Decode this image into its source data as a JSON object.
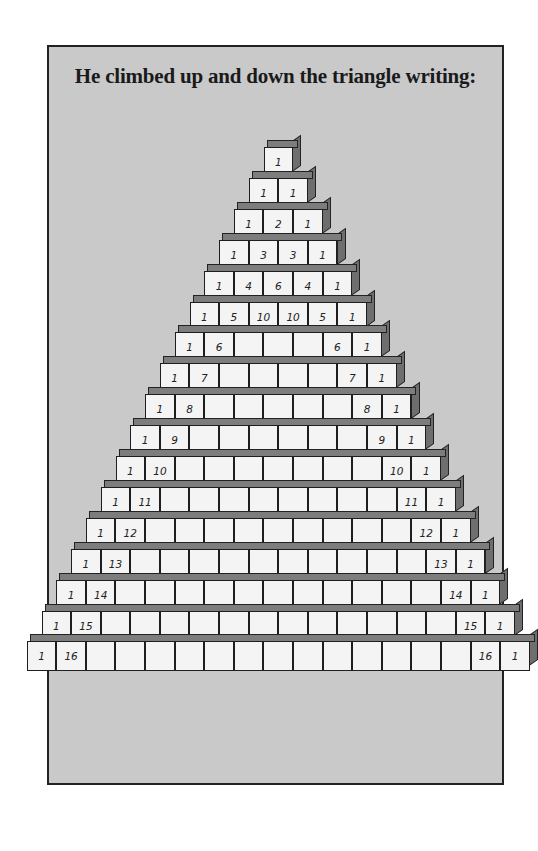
{
  "caption": "He climbed up and down the triangle writing:",
  "colors": {
    "background": "#ffffff",
    "panel": "#c9c9c9",
    "block_face": "#f4f4f4",
    "block_side": "#6e6e6e",
    "outline": "#1e1e1e"
  },
  "pyramid": {
    "rows": [
      [
        "1"
      ],
      [
        "1",
        "1"
      ],
      [
        "1",
        "2",
        "1"
      ],
      [
        "1",
        "3",
        "3",
        "1"
      ],
      [
        "1",
        "4",
        "6",
        "4",
        "1"
      ],
      [
        "1",
        "5",
        "10",
        "10",
        "5",
        "1"
      ],
      [
        "1",
        "6",
        "",
        "",
        "",
        "6",
        "1"
      ],
      [
        "1",
        "7",
        "",
        "",
        "",
        "",
        "7",
        "1"
      ],
      [
        "1",
        "8",
        "",
        "",
        "",
        "",
        "",
        "8",
        "1"
      ],
      [
        "1",
        "9",
        "",
        "",
        "",
        "",
        "",
        "",
        "9",
        "1"
      ],
      [
        "1",
        "10",
        "",
        "",
        "",
        "",
        "",
        "",
        "",
        "10",
        "1"
      ],
      [
        "1",
        "11",
        "",
        "",
        "",
        "",
        "",
        "",
        "",
        "",
        "11",
        "1"
      ],
      [
        "1",
        "12",
        "",
        "",
        "",
        "",
        "",
        "",
        "",
        "",
        "",
        "12",
        "1"
      ],
      [
        "1",
        "13",
        "",
        "",
        "",
        "",
        "",
        "",
        "",
        "",
        "",
        "",
        "13",
        "1"
      ],
      [
        "1",
        "14",
        "",
        "",
        "",
        "",
        "",
        "",
        "",
        "",
        "",
        "",
        "",
        "14",
        "1"
      ],
      [
        "1",
        "15",
        "",
        "",
        "",
        "",
        "",
        "",
        "",
        "",
        "",
        "",
        "",
        "",
        "15",
        "1"
      ],
      [
        "1",
        "16",
        "",
        "",
        "",
        "",
        "",
        "",
        "",
        "",
        "",
        "",
        "",
        "",
        "",
        "16",
        "1"
      ]
    ]
  }
}
